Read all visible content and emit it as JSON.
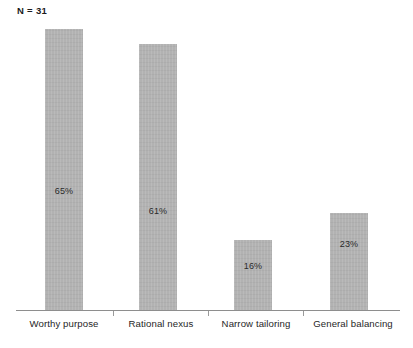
{
  "annotation": {
    "sample_size": "N = 31"
  },
  "chart_data": {
    "type": "bar",
    "title": "",
    "subtitle": "",
    "xlabel": "",
    "ylabel": "",
    "categories": [
      "Worthy purpose",
      "Rational nexus",
      "Narrow tailoring",
      "General balancing"
    ],
    "values": [
      65,
      61,
      16,
      23
    ],
    "value_labels": [
      "65%",
      "61%",
      "16%",
      "23%"
    ],
    "unit": "%",
    "ylim": [
      0,
      72
    ],
    "grid": false,
    "legend": null,
    "annotations": [
      "N = 31"
    ],
    "bar_color": "#b2b2b2",
    "axis_color": "#8e8e8e",
    "label_color": "#1f1f1f",
    "background": "#ffffff",
    "series": [
      {
        "name": "Percentage of cases",
        "values": [
          65,
          61,
          16,
          23
        ]
      }
    ]
  },
  "geometry": {
    "bars": [
      {
        "left": 45,
        "width": 38,
        "top": 29,
        "height": 282,
        "label_top": 186
      },
      {
        "left": 139,
        "width": 38,
        "top": 44,
        "height": 267,
        "label_top": 206
      },
      {
        "left": 234,
        "width": 38,
        "top": 240,
        "height": 71,
        "label_top": 261
      },
      {
        "left": 330,
        "width": 38,
        "top": 213,
        "height": 98,
        "label_top": 239
      }
    ],
    "ticks": [
      113,
      208,
      303
    ],
    "cat_label_positions": [
      {
        "left": 14,
        "width": 100
      },
      {
        "left": 113,
        "width": 96
      },
      {
        "left": 208,
        "width": 96
      },
      {
        "left": 303,
        "width": 100
      }
    ]
  }
}
